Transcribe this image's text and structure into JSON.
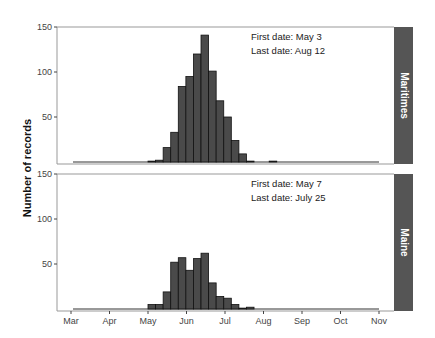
{
  "chart_data": {
    "type": "bar",
    "ylabel": "Number of records",
    "xlabel": "",
    "x_ticks": [
      "Mar",
      "Apr",
      "May",
      "Jun",
      "Jul",
      "Aug",
      "Sep",
      "Oct",
      "Nov"
    ],
    "y_ticks": [
      50,
      100,
      150
    ],
    "ylim": [
      0,
      150
    ],
    "bin_width_days": 6,
    "bar_color": "#4a4a4a",
    "strip_color": "#555555",
    "panels": [
      {
        "name": "Maritimes",
        "first_date": "First date: May 3",
        "last_date": "Last date: Aug 12",
        "bins_start_offset_from_may1": 0,
        "values": [
          1,
          2,
          16,
          33,
          84,
          95,
          120,
          141,
          101,
          68,
          50,
          24,
          9,
          1,
          0,
          0,
          1
        ]
      },
      {
        "name": "Maine",
        "first_date": "First date: May 7",
        "last_date": "Last date: July 25",
        "bins_start_offset_from_may1": 0,
        "values": [
          5,
          5,
          19,
          52,
          57,
          43,
          56,
          62,
          29,
          14,
          12,
          5,
          1,
          2
        ]
      }
    ]
  }
}
